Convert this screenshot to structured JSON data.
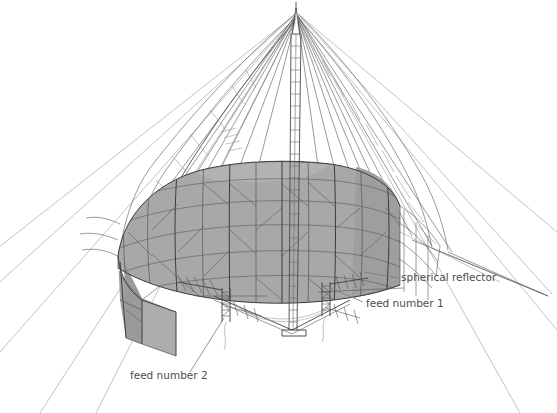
{
  "figure": {
    "background_color": "#ffffff",
    "width": 557,
    "height": 413
  },
  "style": {
    "reflector_fill": "#a8a8a8",
    "reflector_fill_shade": "#9c9c9c",
    "reflector_fill_light": "#b4b4b4",
    "line_color": "#3c3c3c",
    "guy_color": "#6e6e6e",
    "guy_faint_color": "#9a9a9a",
    "label_color": "#4d4d4d",
    "leader_color": "#7a7a7a"
  },
  "labels": [
    {
      "id": "spherical-reflector",
      "text": "spherical reflector",
      "x": 401,
      "y": 281,
      "anchor": "start"
    },
    {
      "id": "feed-number-1",
      "text": "feed number 1",
      "x": 366,
      "y": 307,
      "anchor": "start"
    },
    {
      "id": "feed-number-2",
      "text": "feed number 2",
      "x": 130,
      "y": 379,
      "anchor": "start"
    }
  ],
  "components": {
    "mast": {
      "name": "central lattice mast",
      "apex_x": 296,
      "apex_y": 10,
      "base_x": 292,
      "base_y": 330
    },
    "reflector": {
      "name": "spherical reflector mesh surface",
      "center_x": 278,
      "top_y": 163,
      "left_x": 118,
      "right_x": 400
    },
    "feed_1": {
      "name": "feed number 1 antenna assembly",
      "x": 326,
      "y": 296
    },
    "feed_2": {
      "name": "feed number 2 antenna assembly",
      "x": 228,
      "y": 300
    }
  }
}
